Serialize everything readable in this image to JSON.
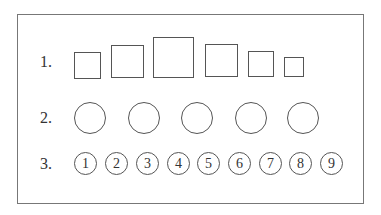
{
  "rows": [
    {
      "label": "1.",
      "label_pos": {
        "x": 40,
        "y": 62
      },
      "shape": "square",
      "items": [
        {
          "x": 74,
          "y": 52,
          "size": 27
        },
        {
          "x": 111,
          "y": 45,
          "size": 33
        },
        {
          "x": 153,
          "y": 37,
          "size": 41
        },
        {
          "x": 205,
          "y": 44,
          "size": 33
        },
        {
          "x": 248,
          "y": 51,
          "size": 26
        },
        {
          "x": 284,
          "y": 57,
          "size": 20
        }
      ]
    },
    {
      "label": "2.",
      "label_pos": {
        "x": 40,
        "y": 118
      },
      "shape": "circle",
      "items": [
        {
          "cx": 90,
          "cy": 118,
          "d": 32
        },
        {
          "cx": 144,
          "cy": 118,
          "d": 32
        },
        {
          "cx": 197,
          "cy": 118,
          "d": 32
        },
        {
          "cx": 251,
          "cy": 118,
          "d": 32
        },
        {
          "cx": 303,
          "cy": 118,
          "d": 32
        }
      ]
    },
    {
      "label": "3.",
      "label_pos": {
        "x": 40,
        "y": 164
      },
      "shape": "numbered-circle",
      "items": [
        {
          "cx": 86,
          "cy": 164,
          "d": 23,
          "text": "1"
        },
        {
          "cx": 117,
          "cy": 164,
          "d": 23,
          "text": "2"
        },
        {
          "cx": 148,
          "cy": 164,
          "d": 23,
          "text": "3"
        },
        {
          "cx": 179,
          "cy": 164,
          "d": 23,
          "text": "4"
        },
        {
          "cx": 209,
          "cy": 164,
          "d": 23,
          "text": "5"
        },
        {
          "cx": 240,
          "cy": 164,
          "d": 23,
          "text": "6"
        },
        {
          "cx": 271,
          "cy": 164,
          "d": 23,
          "text": "7"
        },
        {
          "cx": 301,
          "cy": 164,
          "d": 23,
          "text": "8"
        },
        {
          "cx": 332,
          "cy": 164,
          "d": 23,
          "text": "9"
        }
      ]
    }
  ]
}
